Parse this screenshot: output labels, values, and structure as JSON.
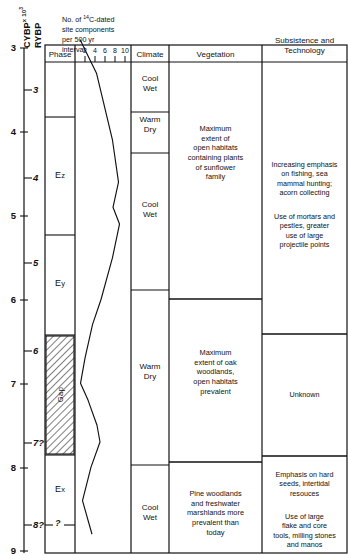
{
  "axes": {
    "left_label": "CYBP",
    "left_label_sup": "x 10",
    "left_label_exp": "3",
    "right_label": "RYBP",
    "left_ticks": [
      "3",
      "4",
      "5",
      "6",
      "7",
      "8",
      "9"
    ],
    "right_ticks": [
      "3",
      "4",
      "5",
      "6",
      "7?",
      "8?"
    ]
  },
  "columns": {
    "phase": "Phase",
    "c14_line1": "No. of ",
    "c14_sup": "14",
    "c14_line1b": "C-dated",
    "c14_line2": "site components",
    "c14_line3": "per 500 yr",
    "c14_line4": "interval",
    "climate": "Climate",
    "vegetation": "Vegetation",
    "subsistence_line1": "Subsistence and",
    "subsistence_line2": "Technology"
  },
  "c14_scale": {
    "ticks": [
      "2",
      "4",
      "6",
      "8",
      "10"
    ],
    "min": 0,
    "max": 11
  },
  "phases": [
    {
      "label": "Ez",
      "main": "E",
      "sub": "z"
    },
    {
      "label": "Ey",
      "main": "E",
      "sub": "y"
    },
    {
      "label": "Gap",
      "main": "Gap",
      "sub": ""
    },
    {
      "label": "Ex",
      "main": "E",
      "sub": "x"
    }
  ],
  "phase_query": "?",
  "climate": [
    {
      "line1": "Cool",
      "line2": "Wet"
    },
    {
      "line1": "Warm",
      "line2": "Dry"
    },
    {
      "line1": "Cool",
      "line2": "Wet"
    },
    {
      "line1": "Warm",
      "line2": "Dry"
    },
    {
      "line1": "Cool",
      "line2": "Wet"
    }
  ],
  "vegetation": [
    "Maximum\nextent of\nopen habitats\ncontaining plants\nof sunflower\nfamily",
    "Maximum\nextent of oak\nwoodlands,\nopen habitats\nprevalent",
    "Pine woodlands\nand freshwater\nmarshlands more\nprevalent than\ntoday"
  ],
  "subsistence": [
    "Increasing emphasis\non fishing, sea\nmammal hunting;\nacorn collecting",
    "Use of mortars and\npestles, greater\nuse of large\nprojectile points",
    "Unknown",
    "Emphasis on hard\nseeds, intertidal\nresouces",
    "Use of large\nflake and core\ntools, milling stones\nand manos"
  ],
  "chart_data": {
    "type": "line",
    "title": "No. of 14C-dated site components per 500 yr interval",
    "xlabel": "No. of 14C-dated site components per 500 yr interval",
    "ylabel": "CYBP x 10^3 / RYBP",
    "xlim": [
      0,
      11
    ],
    "ylim": [
      9,
      2.7
    ],
    "grid": false,
    "legend": "none",
    "orientation": "vertical-time-axis",
    "x": [
      1.0,
      4.3,
      7.5,
      8.7,
      7.6,
      8.9,
      7.5,
      5.2,
      3.5,
      2.0,
      1.1,
      2.6,
      4.4,
      5.0,
      3.2,
      1.5,
      3.4
    ],
    "y": [
      2.9,
      3.3,
      4.1,
      4.6,
      4.9,
      5.1,
      5.5,
      6.0,
      6.3,
      6.7,
      7.0,
      7.2,
      7.5,
      7.7,
      8.0,
      8.4,
      8.8
    ],
    "series": [
      {
        "name": "14C-dated site components per 500 yr",
        "points": [
          [
            1.0,
            2.9
          ],
          [
            4.3,
            3.3
          ],
          [
            7.5,
            4.1
          ],
          [
            8.7,
            4.6
          ],
          [
            7.6,
            4.9
          ],
          [
            8.9,
            5.1
          ],
          [
            7.5,
            5.5
          ],
          [
            5.2,
            6.0
          ],
          [
            3.5,
            6.3
          ],
          [
            2.0,
            6.7
          ],
          [
            1.1,
            7.0
          ],
          [
            2.6,
            7.2
          ],
          [
            4.4,
            7.5
          ],
          [
            5.0,
            7.7
          ],
          [
            3.2,
            8.0
          ],
          [
            1.5,
            8.4
          ],
          [
            3.4,
            8.8
          ]
        ]
      }
    ]
  }
}
